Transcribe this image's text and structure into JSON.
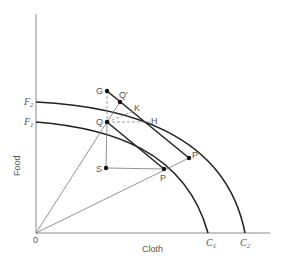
{
  "diagram": {
    "type": "production-possibility-frontier",
    "axes": {
      "x_label": "Cloth",
      "y_label": "Food",
      "origin_label": "0"
    },
    "curves": [
      {
        "name": "F1",
        "y_intercept_label": "F",
        "y_sub": "1",
        "x_intercept_label": "C",
        "x_sub": "1"
      },
      {
        "name": "F2",
        "y_intercept_label": "F",
        "y_sub": "2",
        "x_intercept_label": "C",
        "x_sub": "2"
      }
    ],
    "points": {
      "G": "G",
      "Q_prime": "Q'",
      "K": "K",
      "H": "H",
      "Q": "Q",
      "S": "S",
      "P": "P",
      "P_prime": "P'"
    },
    "colors": {
      "axis": "#777777",
      "curve": "#222222",
      "thin_line": "#666666",
      "label": "#555555"
    }
  }
}
